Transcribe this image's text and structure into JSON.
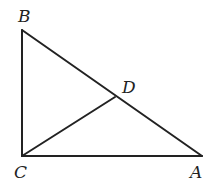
{
  "diagram": {
    "type": "right-triangle",
    "points": {
      "A": {
        "label": "A",
        "x": 202,
        "y": 156
      },
      "B": {
        "label": "B",
        "x": 22,
        "y": 30
      },
      "C": {
        "label": "C",
        "x": 22,
        "y": 156
      },
      "D": {
        "label": "D",
        "x": 115,
        "y": 97
      }
    },
    "segments": [
      "BC",
      "CA",
      "AB",
      "CD"
    ],
    "labels": {
      "A": "A",
      "B": "B",
      "C": "C",
      "D": "D"
    }
  }
}
